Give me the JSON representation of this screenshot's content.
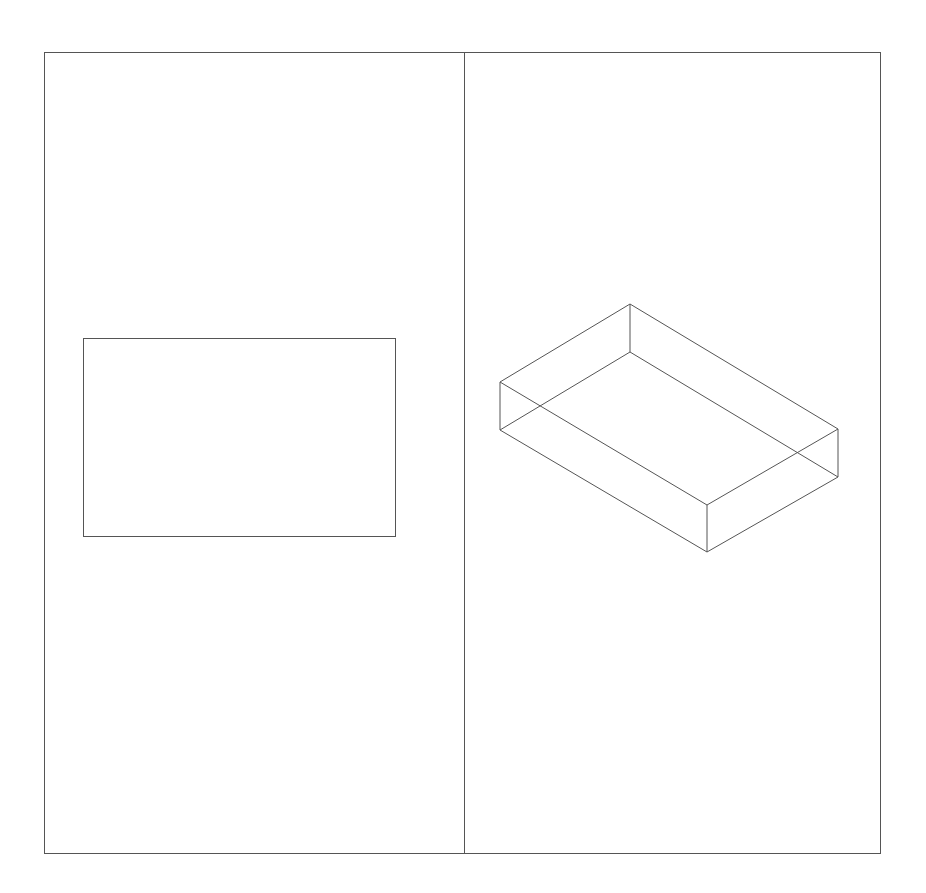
{
  "colors": {
    "background": "#ffffff",
    "stroke": "#555555"
  },
  "frame": {
    "x": 44,
    "y": 52,
    "width": 836,
    "height": 801,
    "divider_x": 464
  },
  "left_panel": {
    "view": "top",
    "rectangle": {
      "x": 83,
      "y": 338,
      "width": 312,
      "height": 198
    }
  },
  "right_panel": {
    "view": "isometric",
    "box": {
      "top_face": [
        [
          630,
          304
        ],
        [
          838,
          429
        ],
        [
          707,
          505
        ],
        [
          500,
          382
        ]
      ],
      "bottom_face": [
        [
          630,
          352
        ],
        [
          838,
          477
        ],
        [
          707,
          552
        ],
        [
          500,
          430
        ]
      ]
    }
  }
}
